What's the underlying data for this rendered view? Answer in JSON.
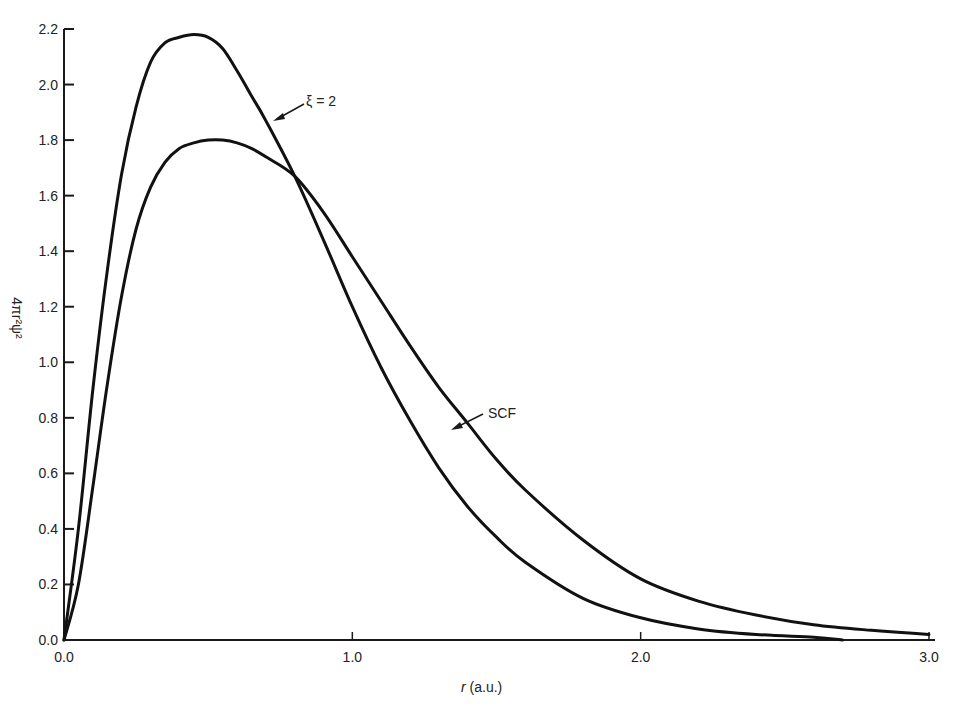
{
  "chart_data": {
    "type": "line",
    "title": "",
    "xlabel_var": "r",
    "xlabel_unit": " (a.u.)",
    "ylabel": "4πr²ψ²",
    "xlim": [
      0.0,
      3.0
    ],
    "ylim": [
      0.0,
      2.2
    ],
    "xticks": [
      "0.0",
      "1.0",
      "2.0",
      "3.0"
    ],
    "xtick_values": [
      0,
      1,
      2,
      3
    ],
    "yticks": [
      "0.0",
      "0.2",
      "0.4",
      "0.6",
      "0.8",
      "1.0",
      "1.2",
      "1.4",
      "1.6",
      "1.8",
      "2.0",
      "2.2"
    ],
    "ytick_values": [
      0,
      0.2,
      0.4,
      0.6,
      0.8,
      1.0,
      1.2,
      1.4,
      1.6,
      1.8,
      2.0,
      2.2
    ],
    "grid": false,
    "legend": "none",
    "series": [
      {
        "name": "ξ = 2",
        "annotation": "ξ = 2",
        "x": [
          0.0,
          0.05,
          0.1,
          0.15,
          0.2,
          0.25,
          0.3,
          0.35,
          0.4,
          0.45,
          0.5,
          0.55,
          0.6,
          0.65,
          0.7,
          0.8,
          0.9,
          1.0,
          1.1,
          1.2,
          1.3,
          1.4,
          1.5,
          1.6,
          1.8,
          2.0,
          2.2,
          2.4,
          2.6,
          2.7
        ],
        "y": [
          0.0,
          0.4,
          0.9,
          1.33,
          1.68,
          1.92,
          2.08,
          2.15,
          2.17,
          2.18,
          2.17,
          2.13,
          2.05,
          1.96,
          1.87,
          1.67,
          1.44,
          1.2,
          0.98,
          0.79,
          0.62,
          0.48,
          0.37,
          0.28,
          0.15,
          0.08,
          0.04,
          0.02,
          0.01,
          0.0
        ]
      },
      {
        "name": "SCF",
        "annotation": "SCF",
        "x": [
          0.0,
          0.05,
          0.1,
          0.15,
          0.2,
          0.25,
          0.3,
          0.35,
          0.4,
          0.45,
          0.5,
          0.55,
          0.6,
          0.65,
          0.7,
          0.8,
          0.9,
          1.0,
          1.1,
          1.2,
          1.3,
          1.4,
          1.5,
          1.6,
          1.8,
          2.0,
          2.2,
          2.4,
          2.6,
          2.8,
          3.0
        ],
        "y": [
          0.0,
          0.2,
          0.55,
          0.92,
          1.24,
          1.48,
          1.63,
          1.72,
          1.77,
          1.79,
          1.8,
          1.8,
          1.79,
          1.77,
          1.74,
          1.67,
          1.54,
          1.38,
          1.22,
          1.06,
          0.91,
          0.78,
          0.65,
          0.54,
          0.36,
          0.22,
          0.14,
          0.09,
          0.055,
          0.035,
          0.02
        ]
      }
    ]
  }
}
